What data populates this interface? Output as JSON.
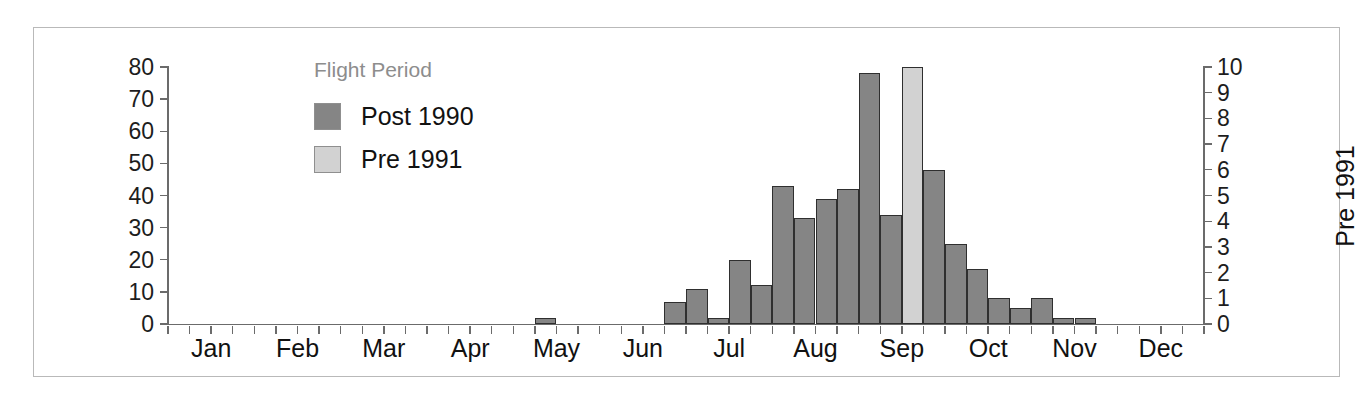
{
  "legend": {
    "title": "Flight Period",
    "position": "inside-top-left",
    "items": [
      {
        "label": "Post 1990",
        "color": "#858585"
      },
      {
        "label": "Pre 1991",
        "color": "#d2d2d2"
      }
    ]
  },
  "axes": {
    "left": {
      "title": "Post 1990",
      "ticks": [
        0,
        10,
        20,
        30,
        40,
        50,
        60,
        70,
        80
      ],
      "min": 0,
      "max": 80
    },
    "right": {
      "title": "Pre 1991",
      "ticks": [
        0,
        1,
        2,
        3,
        4,
        5,
        6,
        7,
        8,
        9,
        10
      ],
      "min": 0,
      "max": 10
    },
    "x": {
      "labels": [
        "Jan",
        "Feb",
        "Mar",
        "Apr",
        "May",
        "Jun",
        "Jul",
        "Aug",
        "Sep",
        "Oct",
        "Nov",
        "Dec"
      ]
    }
  },
  "chart_data": {
    "type": "bar",
    "title": "",
    "xlabel": "",
    "ylabel": "Post 1990",
    "y2label": "Pre 1991",
    "ylim": [
      0,
      80
    ],
    "y2lim": [
      0,
      10
    ],
    "grid": false,
    "legend_title": "Flight Period",
    "legend_position": "inside-top-left",
    "bin": "weekly",
    "categories": [
      "Jan w1",
      "Jan w2",
      "Jan w3",
      "Jan w4",
      "Feb w1",
      "Feb w2",
      "Feb w3",
      "Feb w4",
      "Mar w1",
      "Mar w2",
      "Mar w3",
      "Mar w4",
      "Apr w1",
      "Apr w2",
      "Apr w3",
      "Apr w4",
      "May w1",
      "May w2",
      "May w3",
      "May w4",
      "Jun w1",
      "Jun w2",
      "Jun w3",
      "Jun w4",
      "Jul w1",
      "Jul w2",
      "Jul w3",
      "Jul w4",
      "Aug w1",
      "Aug w2",
      "Aug w3",
      "Aug w4",
      "Sep w1",
      "Sep w2",
      "Sep w3",
      "Sep w4",
      "Oct w1",
      "Oct w2",
      "Oct w3",
      "Oct w4",
      "Nov w1",
      "Nov w2",
      "Nov w3",
      "Nov w4",
      "Dec w1",
      "Dec w2",
      "Dec w3",
      "Dec w4"
    ],
    "series": [
      {
        "name": "Post 1990",
        "color": "#858585",
        "axis": "left",
        "values": [
          0,
          0,
          0,
          0,
          0,
          0,
          0,
          0,
          0,
          0,
          0,
          0,
          0,
          0,
          0,
          0,
          0,
          2,
          0,
          0,
          0,
          0,
          0,
          7,
          11,
          2,
          20,
          12,
          43,
          33,
          39,
          42,
          78,
          34,
          41,
          48,
          25,
          17,
          8,
          5,
          8,
          2,
          2,
          0,
          0,
          0,
          0,
          0
        ]
      },
      {
        "name": "Pre 1991",
        "color": "#d2d2d2",
        "axis": "right",
        "values": [
          0,
          0,
          0,
          0,
          0,
          0,
          0,
          0,
          0,
          0,
          0,
          0,
          0,
          0,
          0,
          0,
          0,
          0,
          0,
          0,
          0,
          0,
          0,
          0,
          0,
          0,
          0,
          0,
          0,
          0,
          0,
          0,
          0,
          0,
          10,
          0,
          0,
          0,
          0,
          0,
          0,
          0,
          0,
          0,
          0,
          0,
          0,
          0
        ]
      }
    ]
  }
}
